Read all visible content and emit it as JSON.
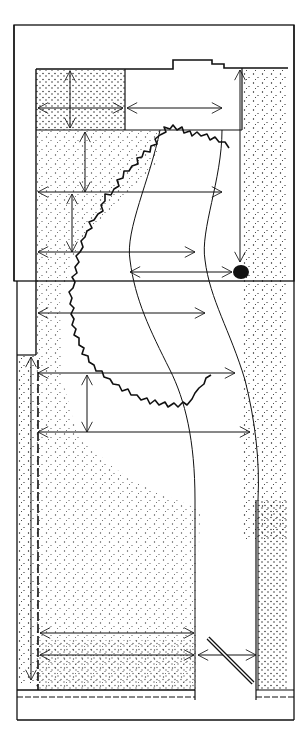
{
  "diagram": {
    "kind": "site-plan",
    "colors": {
      "ink": "#111111",
      "paper": "#ffffff"
    },
    "elements": {
      "outer_frame": "outer-border",
      "house_outline": "house-footprint",
      "stippled_areas": [
        "stipple-top-left",
        "stipple-top-right",
        "stipple-left-strip",
        "stipple-bed"
      ],
      "planting_edge": "wavy-bed-edge",
      "path_lines": [
        "curved-path-left",
        "curved-path-right"
      ],
      "focal_point": "dark-focal-blob",
      "gate": "diagonal-gate",
      "dimension_arrows_count": 14
    },
    "labels": []
  }
}
